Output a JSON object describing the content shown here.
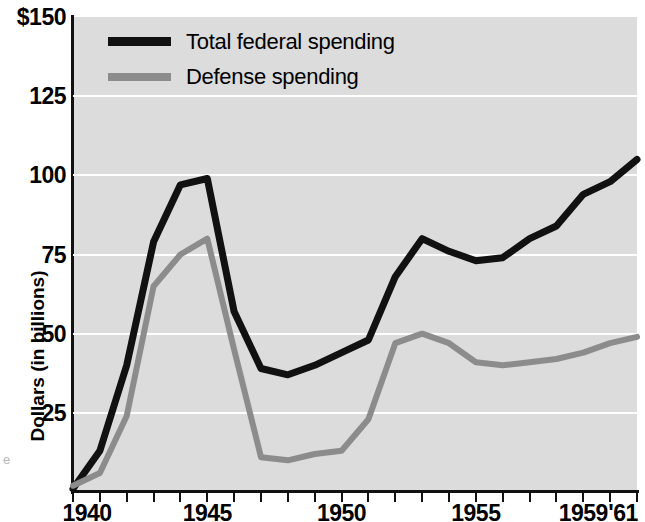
{
  "chart_data": {
    "type": "line",
    "title": "",
    "xlabel": "",
    "ylabel": "Dollars (in billions)",
    "xlim": [
      1940,
      1961
    ],
    "ylim": [
      0,
      150
    ],
    "grid": true,
    "legend_position": "top-left",
    "x": [
      1940,
      1941,
      1942,
      1943,
      1944,
      1945,
      1946,
      1947,
      1948,
      1949,
      1950,
      1951,
      1952,
      1953,
      1954,
      1955,
      1956,
      1957,
      1958,
      1959,
      1960,
      1961
    ],
    "xtick_labels": [
      "1940",
      "1945",
      "1950",
      "1955",
      "1959",
      "'61"
    ],
    "xtick_values": [
      1940,
      1945,
      1950,
      1955,
      1959,
      1961
    ],
    "ytick_labels": [
      "$150",
      "125",
      "100",
      "75",
      "50",
      "25"
    ],
    "ytick_values": [
      150,
      125,
      100,
      75,
      50,
      25
    ],
    "series": [
      {
        "name": "Total federal spending",
        "color": "#111111",
        "values": [
          1,
          13,
          40,
          79,
          97,
          99,
          57,
          39,
          37,
          40,
          44,
          48,
          68,
          80,
          76,
          73,
          74,
          80,
          84,
          94,
          98,
          105
        ]
      },
      {
        "name": "Defense spending",
        "color": "#8c8c8c",
        "values": [
          2,
          6,
          24,
          65,
          75,
          80,
          45,
          11,
          10,
          12,
          13,
          23,
          47,
          50,
          47,
          41,
          40,
          41,
          42,
          44,
          47,
          49
        ]
      }
    ]
  },
  "legend": {
    "items": [
      {
        "label": "Total federal spending",
        "swatch": "total"
      },
      {
        "label": "Defense spending",
        "swatch": "defense"
      }
    ]
  },
  "axes": {
    "y_title": "Dollars (in billions)"
  },
  "artifacts": {
    "left_margin_text": "e"
  }
}
